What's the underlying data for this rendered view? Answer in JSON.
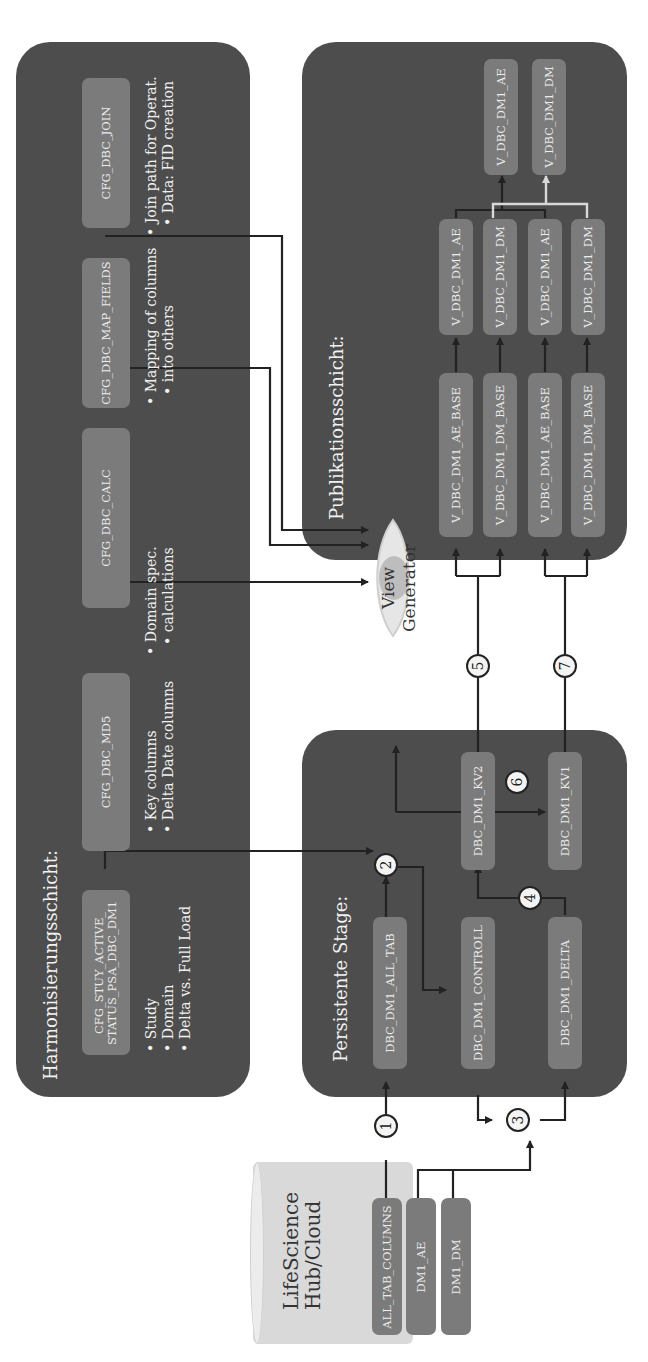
{
  "harmonization": {
    "title": "Harmonisierungsschicht:",
    "configs": [
      {
        "label": "CFG_STUY_ACTIVE_\nSTATUS_PSA_DBC_DM1",
        "line1": "CFG_STUY_ACTIVE_",
        "line2": "STATUS_PSA_DBC_DM1",
        "bullets": [
          "Study",
          "Domain",
          "Delta vs. Full Load"
        ]
      },
      {
        "label": "CFG_DBC_MD5",
        "bullets": [
          "Key columns",
          "Delta Date columns"
        ]
      },
      {
        "label": "CFG_DBC_CALC",
        "bullets": [
          "Domain spec.",
          "calculations"
        ]
      },
      {
        "label": "CFG_DBC_MAP_FIELDS",
        "bullets": [
          "Mapping of columns",
          "into others"
        ]
      },
      {
        "label": "CFG_DBC_JOIN",
        "bullets": [
          "Join path for Operat.",
          "Data: FID creation"
        ]
      }
    ]
  },
  "psa": {
    "title": "Persistente Stage:",
    "tables": {
      "all_tab": "DBC_DM1_ALL_TAB",
      "controll": "DBC_DM1_CONTROLL",
      "delta": "DBC_DM1_DELTA",
      "kv2": "DBC_DM1_KV2",
      "kv1": "DBC_DM1_KV1"
    }
  },
  "publication": {
    "title": "Publikationsschicht:",
    "base_views": [
      "V_DBC_DM1_AE_BASE",
      "V_DBC_DM1_DM_BASE",
      "V_DBC_DM1_AE_BASE",
      "V_DBC_DM1_DM_BASE"
    ],
    "mid_views": [
      "V_DBC_DM1_AE",
      "V_DBC_DM1_DM",
      "V_DBC_DM1_AE",
      "V_DBC_DM1_DM"
    ],
    "final_views": [
      "V_DBC_DM1_AE",
      "V_DBC_DM1_DM"
    ]
  },
  "view_generator": {
    "line1": "View",
    "line2": "Generator"
  },
  "source": {
    "title_line1": "LifeScience",
    "title_line2": "Hub/Cloud",
    "tables": [
      "ALL_TAB_COLUMNS",
      "DM1_AE",
      "DM1_DM"
    ]
  },
  "steps": [
    "1",
    "2",
    "3",
    "4",
    "5",
    "6",
    "7"
  ],
  "colors": {
    "panel": "#4d4d4d",
    "node": "#7b7b7b",
    "cylinder": "#d9d9d9",
    "wire": "#222222",
    "highlight_wire": "#d8d8d8"
  }
}
